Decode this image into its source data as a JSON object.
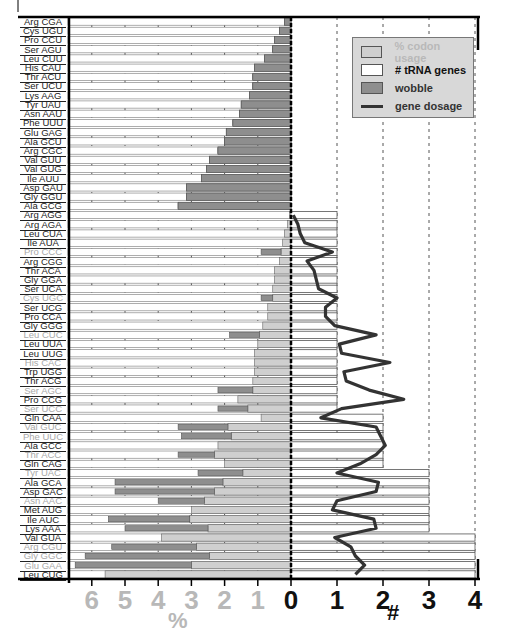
{
  "chart_data": {
    "type": "bar",
    "orientation": "horizontal",
    "title": "",
    "x_left_label": "%",
    "x_right_label": "#",
    "x_left_ticks": [
      "6",
      "5",
      "4",
      "3",
      "2",
      "1",
      "0"
    ],
    "x_right_ticks": [
      "0",
      "1",
      "2",
      "3",
      "4"
    ],
    "xlim_left": [
      6.8,
      0
    ],
    "xlim_right": [
      0,
      4.3
    ],
    "grid": "vertical dashed",
    "legend": {
      "position": "top-right",
      "entries": [
        {
          "label": "% codon usage",
          "swatch": "#cfcfcf",
          "text_color": "#b8b8b8"
        },
        {
          "label": "# tRNA genes",
          "swatch": "#ffffff",
          "text_color": "#111111"
        },
        {
          "label": "wobble",
          "swatch": "#8e8e8e",
          "text_color": "#333333"
        },
        {
          "label": "gene dosage",
          "swatch": "line",
          "text_color": "#333333"
        }
      ]
    },
    "colors": {
      "usage": "#cfcfcf",
      "wobble": "#8e8e8e",
      "trna": "#ffffff",
      "dosage": "#333333"
    },
    "categories": [
      "Arg CGA",
      "Cys UGU",
      "Pro CCU",
      "Ser AGU",
      "Leu CUU",
      "His CAU",
      "Thr ACU",
      "Ser UCU",
      "Lys AAG",
      "Tyr UAU",
      "Asn AAU",
      "Phe UUU",
      "Glu GAG",
      "Ala GCU",
      "Arg CGC",
      "Val GUU",
      "Val GUG",
      "Ile AUU",
      "Asp GAU",
      "Gly GGU",
      "Ala GCG",
      "Arg AGG",
      "Arg AGA",
      "Leu CUA",
      "Ile AUA",
      "Pro CCC",
      "Arg CGG",
      "Thr ACA",
      "Gly GGA",
      "Ser UCA",
      "Cys UGC",
      "Ser UCG",
      "Pro CCA",
      "Gly GGG",
      "Leu CUC",
      "Leu UUA",
      "Leu UUG",
      "His CAC",
      "Trp UGG",
      "Thr ACG",
      "Ser AGC",
      "Pro CCG",
      "Ser UCC",
      "Gln CAA",
      "Val GUC",
      "Phe UUC",
      "Ala GCC",
      "Thr ACC",
      "Gln CAG",
      "Tyr UAC",
      "Ala GCA",
      "Asp GAC",
      "Asn AAC",
      "Met AUG",
      "Ile AUC",
      "Lys AAA",
      "Val GUA",
      "Arg CGU",
      "Gly GGC",
      "Glu GAA",
      "Leu CUG"
    ],
    "label_gray": [
      false,
      false,
      false,
      false,
      false,
      false,
      false,
      false,
      false,
      false,
      false,
      false,
      false,
      false,
      false,
      false,
      false,
      false,
      false,
      false,
      false,
      false,
      false,
      false,
      false,
      true,
      false,
      false,
      false,
      false,
      true,
      false,
      false,
      false,
      true,
      false,
      false,
      true,
      false,
      false,
      true,
      false,
      true,
      false,
      true,
      true,
      false,
      true,
      false,
      true,
      false,
      false,
      true,
      false,
      false,
      false,
      false,
      true,
      true,
      true,
      false
    ],
    "series": [
      {
        "name": "% codon usage",
        "values": [
          0.2,
          0.35,
          0.5,
          0.55,
          0.8,
          1.1,
          1.15,
          1.15,
          1.25,
          1.5,
          1.55,
          1.75,
          1.95,
          2.0,
          2.2,
          2.45,
          2.55,
          2.7,
          3.15,
          3.15,
          3.4,
          0.05,
          0.1,
          0.2,
          0.25,
          0.3,
          0.35,
          0.5,
          0.5,
          0.55,
          0.55,
          0.7,
          0.7,
          0.85,
          0.95,
          1.0,
          1.1,
          1.1,
          1.1,
          1.15,
          1.15,
          1.6,
          1.3,
          0.9,
          1.9,
          1.8,
          2.2,
          2.3,
          2.0,
          1.45,
          2.05,
          2.3,
          2.6,
          3.0,
          3.05,
          2.5,
          3.9,
          2.85,
          2.45,
          3.0,
          5.6
        ]
      },
      {
        "name": "wobble",
        "values": [
          0.2,
          0.35,
          0.5,
          0.55,
          0.8,
          1.1,
          1.15,
          1.15,
          1.25,
          1.5,
          1.55,
          1.75,
          1.95,
          2.0,
          2.2,
          2.45,
          2.55,
          2.7,
          3.15,
          3.15,
          3.4,
          0,
          0,
          0,
          0,
          0.9,
          0,
          0,
          0,
          0,
          0.9,
          0,
          0,
          0,
          1.85,
          0,
          0,
          0,
          0,
          0,
          2.2,
          0,
          2.2,
          0,
          3.4,
          3.3,
          2.0,
          3.4,
          0,
          2.8,
          5.3,
          5.3,
          4.0,
          3.0,
          5.5,
          5.0,
          3.5,
          5.4,
          6.2,
          6.5,
          0
        ]
      },
      {
        "name": "# tRNA genes",
        "values": [
          0,
          0,
          0,
          0,
          0,
          0,
          0,
          0,
          0,
          0,
          0,
          0,
          0,
          0,
          0,
          0,
          0,
          0,
          0,
          0,
          0,
          1,
          1,
          1,
          1,
          1,
          1,
          1,
          1,
          1,
          1,
          1,
          1,
          1,
          1,
          1,
          1,
          1,
          1,
          1,
          1,
          1,
          1,
          2,
          2,
          2,
          2,
          2,
          2,
          3,
          3,
          3,
          3,
          3,
          3,
          3,
          4,
          4,
          4,
          4,
          4
        ]
      },
      {
        "name": "gene dosage",
        "values": [
          null,
          null,
          null,
          null,
          null,
          null,
          null,
          null,
          null,
          null,
          null,
          null,
          null,
          null,
          null,
          null,
          null,
          null,
          null,
          null,
          null,
          0.05,
          0.15,
          0.2,
          0.3,
          0.9,
          0.35,
          0.5,
          0.55,
          0.6,
          1.0,
          0.75,
          0.75,
          0.95,
          1.85,
          1.05,
          1.1,
          2.15,
          1.15,
          1.2,
          1.7,
          2.45,
          1.1,
          0.65,
          1.85,
          1.95,
          2.05,
          1.85,
          1.5,
          1.0,
          1.9,
          1.85,
          1.0,
          0.9,
          1.8,
          1.85,
          0.95,
          1.3,
          1.4,
          1.6,
          1.4
        ]
      }
    ]
  }
}
